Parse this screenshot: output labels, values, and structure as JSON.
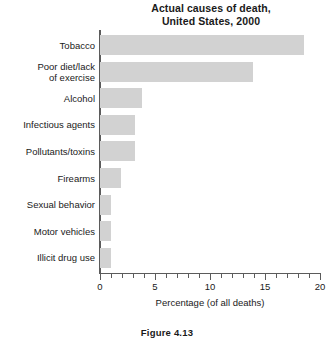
{
  "chart_data": {
    "type": "bar",
    "orientation": "horizontal",
    "title": "Actual causes of death,\nUnited States, 2000",
    "title_lines": [
      "Actual causes of death,",
      "United States, 2000"
    ],
    "xlabel": "Percentage (of all deaths)",
    "ylabel": "",
    "xlim": [
      0,
      20
    ],
    "xticks": [
      0,
      5,
      10,
      15,
      20
    ],
    "xtick_labels": [
      "0",
      "5",
      "10",
      "15",
      "20"
    ],
    "minor_tick_step": 1,
    "grid": false,
    "legend": false,
    "bar_color": "#d2d2d2",
    "axis_color": "#5b5b5b",
    "categories": [
      "Tobacco",
      "Poor diet/lack\nof exercise",
      "Alcohol",
      "Infectious agents",
      "Pollutants/toxins",
      "Firearms",
      "Sexual behavior",
      "Motor vehicles",
      "Illicit drug use"
    ],
    "values": [
      18.5,
      13.9,
      3.8,
      3.2,
      3.2,
      1.9,
      1.0,
      1.0,
      1.0
    ]
  },
  "caption": "Figure 4.13"
}
